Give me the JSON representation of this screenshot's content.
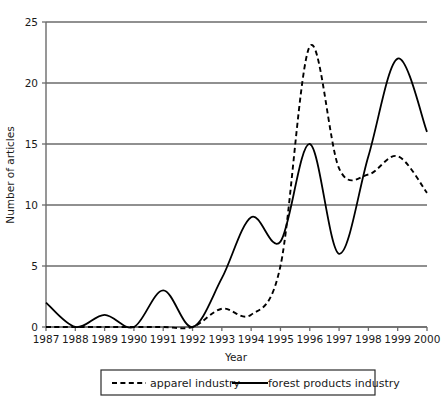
{
  "chart_data": {
    "type": "line",
    "title": "",
    "xlabel": "Year",
    "ylabel": "Number of articles",
    "x": [
      1987,
      1988,
      1989,
      1990,
      1991,
      1992,
      1993,
      1994,
      1995,
      1996,
      1997,
      1998,
      1999,
      2000
    ],
    "xtick_labels": [
      "1987",
      "1988",
      "1989",
      "1990",
      "1991",
      "1992",
      "1993",
      "1994",
      "1995",
      "1996",
      "1997",
      "1998",
      "1999",
      "2000"
    ],
    "ytick_labels": [
      "0",
      "5",
      "10",
      "15",
      "20",
      "25"
    ],
    "ytick_values": [
      0,
      5,
      10,
      15,
      20,
      25
    ],
    "ylim": [
      0,
      25
    ],
    "xlim": [
      1987,
      2000
    ],
    "grid": "horizontal",
    "legend_position": "bottom",
    "series": [
      {
        "name": "apparel industry",
        "style": "dashed",
        "color": "#000000",
        "values": [
          0,
          0,
          0,
          0,
          0,
          0,
          1.5,
          1,
          5,
          23,
          13,
          12.5,
          14,
          11
        ]
      },
      {
        "name": "forest products industry",
        "style": "solid",
        "color": "#000000",
        "values": [
          2,
          0,
          1,
          0,
          3,
          0,
          4,
          9,
          7,
          15,
          6,
          14,
          22,
          16
        ]
      }
    ]
  },
  "axis": {
    "x_title": "Year",
    "y_title": "Number of articles"
  },
  "legend": {
    "items": [
      {
        "label": "apparel industry",
        "style": "dashed"
      },
      {
        "label": "forest products industry",
        "style": "solid"
      }
    ]
  }
}
